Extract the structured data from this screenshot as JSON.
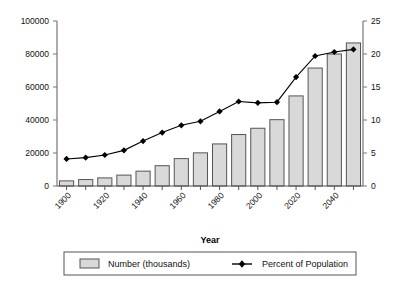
{
  "chart_data": {
    "type": "bar",
    "title": "",
    "xlabel": "Year",
    "ylabel": "",
    "categories": [
      1900,
      1910,
      1920,
      1930,
      1940,
      1950,
      1960,
      1970,
      1980,
      1990,
      2000,
      2010,
      2020,
      2030,
      2040,
      2050
    ],
    "x_tick_labels": [
      "1900",
      "1920",
      "1940",
      "1960",
      "1980",
      "2000",
      "2020",
      "2040"
    ],
    "x_tick_values": [
      1900,
      1920,
      1940,
      1960,
      1980,
      2000,
      2020,
      2040
    ],
    "ylim": [
      0,
      100000
    ],
    "y_ticks": [
      0,
      20000,
      40000,
      60000,
      80000,
      100000
    ],
    "y_tick_labels": [
      "0",
      "20000",
      "40000",
      "60000",
      "80000",
      "100000"
    ],
    "y2lim": [
      0,
      25
    ],
    "y2_ticks": [
      0,
      5,
      10,
      15,
      20,
      25
    ],
    "y2_tick_labels": [
      "0",
      "5",
      "10",
      "15",
      "20",
      "25"
    ],
    "grid": false,
    "legend_position": "bottom",
    "series": [
      {
        "name": "Number (thousands)",
        "type": "bar",
        "axis": "left",
        "color": "#d9d9d9",
        "edge_color": "#555555",
        "values": [
          3100,
          3900,
          4900,
          6600,
          9000,
          12300,
          16600,
          20100,
          25500,
          31200,
          35000,
          40200,
          54600,
          71500,
          80000,
          86700
        ]
      },
      {
        "name": "Percent of Population",
        "type": "line",
        "axis": "right",
        "color": "#000000",
        "marker": "diamond",
        "values": [
          4.1,
          4.3,
          4.7,
          5.4,
          6.8,
          8.1,
          9.2,
          9.8,
          11.3,
          12.8,
          12.6,
          12.7,
          16.5,
          19.7,
          20.3,
          20.7
        ]
      }
    ]
  },
  "legend": {
    "entries": [
      {
        "label": "Number (thousands)",
        "swatch": "bar-swatch"
      },
      {
        "label": "Percent of Population",
        "swatch": "line-marker-swatch"
      }
    ]
  },
  "axis_titles": {
    "x": "Year"
  }
}
